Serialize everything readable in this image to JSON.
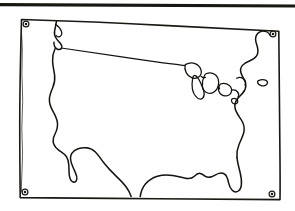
{
  "document": {
    "type": "line-art-illustration",
    "subject": "Outline map of the contiguous United States",
    "medium": "black ink line drawing on white paper",
    "title_text": "",
    "caption_text": "",
    "labels": []
  },
  "canvas": {
    "width": 295,
    "height": 211,
    "background_color": "#ffffff",
    "ink_color": "#15130f"
  },
  "top_rule": {
    "name": "horizontal-rule",
    "visible": true,
    "color": "#191712",
    "x_start": 0,
    "x_end": 295,
    "y": 4,
    "thickness": 3
  },
  "frame": {
    "name": "map-border",
    "shape": "slightly-skewed-rectangle",
    "stroke_color": "#1b1814",
    "stroke_width": 1.6,
    "corners": {
      "top_left": [
        21,
        19
      ],
      "top_right": [
        279,
        31
      ],
      "bottom_right": [
        280,
        200
      ],
      "bottom_left": [
        20,
        197
      ]
    }
  },
  "pins": [
    {
      "name": "grommet-top-left",
      "cx": 26,
      "cy": 24,
      "r": 2.6
    },
    {
      "name": "grommet-top-right",
      "cx": 273,
      "cy": 34,
      "r": 2.6
    },
    {
      "name": "grommet-bottom-right",
      "cx": 272,
      "cy": 194,
      "r": 2.6
    },
    {
      "name": "grommet-bottom-left",
      "cx": 25,
      "cy": 192,
      "r": 2.6
    }
  ],
  "map_features": [
    {
      "name": "us-mainland-outline",
      "description": "Continuous coastline and border outline of the lower 48 states"
    },
    {
      "name": "northern-border",
      "description": "Canada-United States 49th parallel border line"
    },
    {
      "name": "great-lakes",
      "description": "Closed outlines of the Great Lakes"
    },
    {
      "name": "baja-peninsula",
      "description": "Narrow peninsula south-west of California"
    },
    {
      "name": "gulf-of-california",
      "description": "Inlet between Baja peninsula and mainland"
    },
    {
      "name": "florida-peninsula",
      "description": "Peninsula extending south-east at lower right"
    },
    {
      "name": "new-england-coast",
      "description": "North-east coastline including Maine"
    },
    {
      "name": "long-island",
      "description": "Small detached island shape near the east coast"
    },
    {
      "name": "mexico-border",
      "description": "Southern border line running south-east from California"
    }
  ],
  "colors": {
    "paper": "#ffffff",
    "ink": "#15130f",
    "rule": "#191712"
  }
}
